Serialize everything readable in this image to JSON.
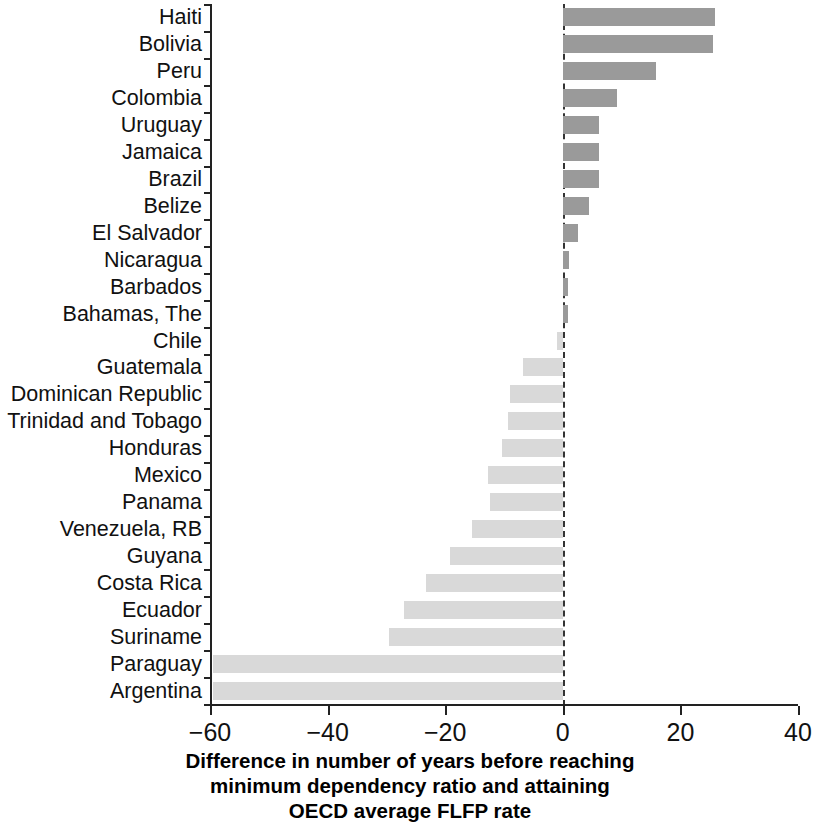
{
  "chart_data": {
    "type": "bar",
    "orientation": "horizontal",
    "title": "",
    "xlabel": "Difference in number of years before reaching minimum dependency ratio and attaining OECD average FLFP rate",
    "xlabel_lines": [
      "Difference in number of years before reaching",
      "minimum dependency ratio and attaining",
      "OECD average FLFP rate"
    ],
    "ylabel": "",
    "xlim": [
      -60,
      40
    ],
    "xticks": [
      -60,
      -40,
      -20,
      0,
      20,
      40
    ],
    "xtick_labels": [
      "−60",
      "−40",
      "−20",
      "0",
      "20",
      "40"
    ],
    "grid": false,
    "legend": "none",
    "zero_reference_line": true,
    "categories": [
      "Haiti",
      "Bolivia",
      "Peru",
      "Colombia",
      "Uruguay",
      "Jamaica",
      "Brazil",
      "Belize",
      "El Salvador",
      "Nicaragua",
      "Barbados",
      "Bahamas, The",
      "Chile",
      "Guatemala",
      "Dominican Republic",
      "Trinidad and Tobago",
      "Honduras",
      "Mexico",
      "Panama",
      "Venezuela, RB",
      "Guyana",
      "Costa Rica",
      "Ecuador",
      "Suriname",
      "Paraguay",
      "Argentina"
    ],
    "values": [
      25.8,
      25.6,
      15.9,
      9.2,
      6.2,
      6.2,
      6.1,
      4.4,
      2.6,
      1.0,
      0.9,
      0.9,
      -1.0,
      -6.7,
      -8.9,
      -9.4,
      -10.3,
      -12.7,
      -12.4,
      -15.4,
      -19.1,
      -23.3,
      -27.0,
      -29.6,
      -59.5,
      -59.5
    ],
    "colors": {
      "positive_bar": "#9a9a9a",
      "negative_bar": "#d9d9d9",
      "axis": "#222222",
      "zero_line": "#333333",
      "text": "#111111",
      "background": "#ffffff"
    }
  }
}
